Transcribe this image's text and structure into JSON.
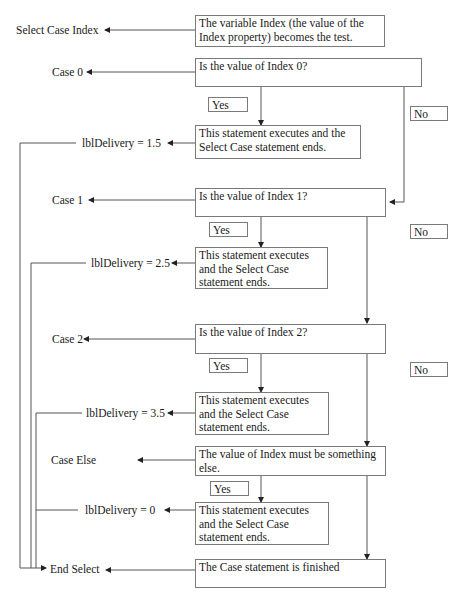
{
  "diagram": {
    "type": "flowchart",
    "code_labels": {
      "select_case": "Select Case Index",
      "case0": "Case 0",
      "assign0": "lblDelivery = 1.5",
      "case1": "Case 1",
      "assign1": "lblDelivery = 2.5",
      "case2": "Case 2",
      "assign2": "lblDelivery = 3.5",
      "case_else": "Case Else",
      "assign_else": "lblDelivery  = 0",
      "end_select": "End Select"
    },
    "boxes": {
      "test": "The variable Index (the value of the Index property) becomes the test.",
      "q0": "Is the value of Index 0?",
      "exec0": "This statement executes and the Select Case statement ends.",
      "q1": "Is the value of Index 1?",
      "exec1": "This statement executes and the Select Case statement ends.",
      "q2": "Is the value of Index 2?",
      "exec2": "This statement executes and the Select Case statement ends.",
      "else": "The value of Index must be something else.",
      "exec_else": "This statement executes and the Select Case statement ends.",
      "finished": "The Case statement is finished"
    },
    "branch_labels": {
      "yes": "Yes",
      "no": "No"
    },
    "colors": {
      "line": "#555555",
      "border": "#7a7a7a"
    }
  }
}
